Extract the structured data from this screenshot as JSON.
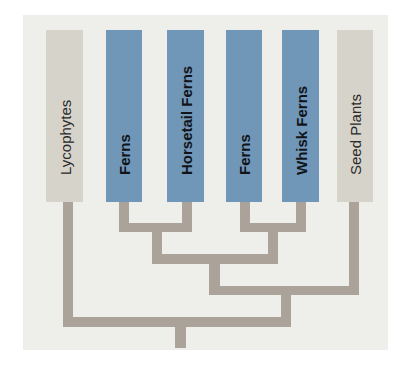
{
  "diagram": {
    "type": "cladogram",
    "colors": {
      "panel": "#eeeeea",
      "nonfern_taxon": "#d6d4ca",
      "fern_taxon": "#7096b8",
      "branch": "#aba29a"
    },
    "taxa": [
      {
        "label": "Lycophytes",
        "group": "other"
      },
      {
        "label": "Ferns",
        "group": "fern"
      },
      {
        "label": "Horsetail Ferns",
        "group": "fern"
      },
      {
        "label": "Ferns",
        "group": "fern"
      },
      {
        "label": "Whisk Ferns",
        "group": "fern"
      },
      {
        "label": "Seed Plants",
        "group": "other"
      }
    ],
    "topology": "(Lycophytes, (((Ferns, Horsetail Ferns), (Ferns, Whisk Ferns)), Seed Plants))"
  }
}
